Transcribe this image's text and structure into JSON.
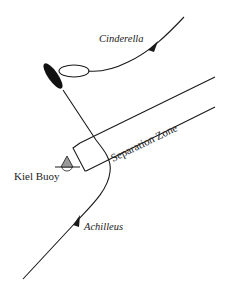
{
  "diagram": {
    "labels": {
      "vessel_1": "Cinderella",
      "vessel_2": "Achilleus",
      "zone": "Separation Zone",
      "buoy": "Kiel Buoy"
    },
    "colors": {
      "ink": "#1a1a1a",
      "buoy_fill": "#999999",
      "background": "#ffffff"
    }
  }
}
